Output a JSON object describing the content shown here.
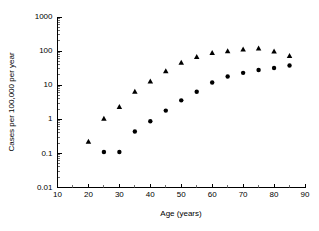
{
  "chart_data": {
    "type": "scatter",
    "title": "",
    "xlabel": "Age (years)",
    "ylabel": "Cases per 100,000 per year",
    "xlim": [
      10,
      90
    ],
    "ylim": [
      0.01,
      1000
    ],
    "yscale": "log",
    "xscale": "linear",
    "grid": false,
    "legend": "none",
    "x_ticks": [
      10,
      20,
      30,
      40,
      50,
      60,
      70,
      80,
      90
    ],
    "x_tick_labels": [
      "10",
      "20",
      "30",
      "40",
      "50",
      "60",
      "70",
      "80",
      "90"
    ],
    "y_ticks": [
      0.01,
      0.1,
      1,
      10,
      100,
      1000
    ],
    "y_tick_labels": [
      "0.01",
      "0.1",
      "1",
      "10",
      "100",
      "1000"
    ],
    "y_minor_ticks": true,
    "series": [
      {
        "name": "triangles",
        "marker": "triangle",
        "color": "#000000",
        "x": [
          20,
          25,
          30,
          35,
          40,
          45,
          50,
          55,
          60,
          65,
          70,
          75,
          80,
          85
        ],
        "values": [
          0.22,
          1.05,
          2.3,
          6.5,
          13,
          26,
          46,
          68,
          88,
          100,
          112,
          120,
          98,
          72
        ]
      },
      {
        "name": "circles",
        "marker": "circle",
        "color": "#000000",
        "x": [
          25,
          30,
          35,
          40,
          45,
          50,
          55,
          60,
          65,
          70,
          75,
          80,
          85
        ],
        "values": [
          0.11,
          0.11,
          0.44,
          0.88,
          1.8,
          3.6,
          6.4,
          12,
          18,
          23,
          28,
          32,
          38
        ]
      }
    ]
  }
}
